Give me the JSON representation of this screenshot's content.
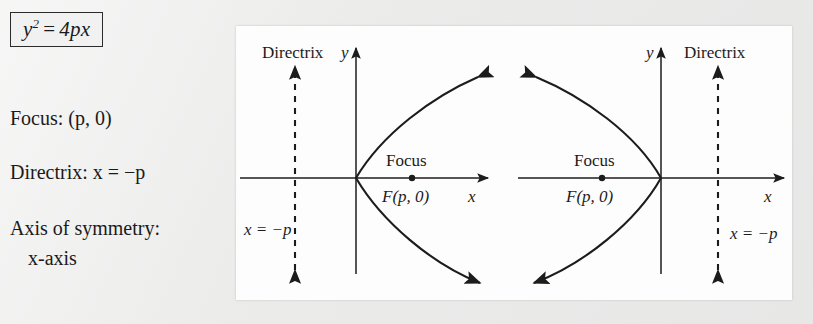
{
  "page": {
    "background_color": "#ebebeb",
    "panel_color": "#fdfdfd",
    "ink_color": "#1c1c1c"
  },
  "formula": {
    "lhs_var": "y",
    "lhs_exponent": "2",
    "equals": "=",
    "rhs": "4px"
  },
  "properties": {
    "focus": "Focus: (p, 0)",
    "focus_label": "Focus:",
    "focus_value": "(p, 0)",
    "directrix": "Directrix: x = −p",
    "directrix_label": "Directrix:",
    "directrix_value": "x = −p",
    "axis_label": "Axis of symmetry:",
    "axis_value": "x-axis"
  },
  "figures": [
    {
      "id": "parabola-opens-right",
      "directrix_label": "Directrix",
      "directrix_equation": "x = −p",
      "focus_label": "Focus",
      "focus_point_label": "F(p, 0)",
      "x_axis_label": "x",
      "y_axis_label": "y",
      "opens": "right",
      "focus_x_px": 412,
      "vertex_x_px": 356,
      "directrix_x_px": 295,
      "axis_y_px": 178
    },
    {
      "id": "parabola-opens-left",
      "directrix_label": "Directrix",
      "directrix_equation": "x = −p",
      "focus_label": "Focus",
      "focus_point_label": "F(p, 0)",
      "x_axis_label": "x",
      "y_axis_label": "y",
      "opens": "left",
      "focus_x_px": 602,
      "vertex_x_px": 661,
      "directrix_x_px": 718,
      "axis_y_px": 178
    }
  ]
}
